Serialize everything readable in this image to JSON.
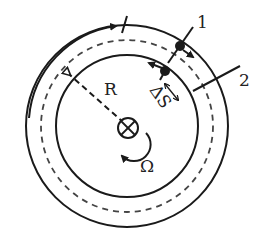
{
  "diagram": {
    "type": "rotating-ring-geometry",
    "labels": {
      "radius": "R",
      "angular_velocity": "Ω",
      "arc_gap": "ΔS",
      "point_1": "1",
      "point_2": "2"
    },
    "colors": {
      "stroke": "#1a1a1a",
      "dashed": "#444444",
      "background": "#ffffff"
    },
    "elements": [
      "outer-circle",
      "dashed-middle-circle",
      "inner-circle",
      "center-axis-symbol",
      "radius-arrow",
      "rotation-arrow",
      "outer-travel-arrow",
      "marker-1",
      "marker-2",
      "delta-s-double-arrow"
    ]
  }
}
